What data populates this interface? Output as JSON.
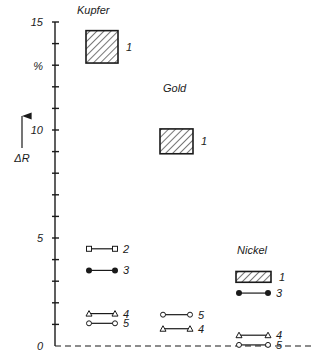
{
  "chart_data": {
    "type": "range",
    "title": "",
    "ylabel": "ΔR",
    "yunit": "%",
    "ylim": [
      0,
      15
    ],
    "yticks_major": [
      0,
      5,
      10,
      15
    ],
    "yticks_minor_step": 1,
    "grid": false,
    "groups": [
      {
        "name": "Kupfer",
        "items": [
          {
            "id": "1",
            "kind": "box",
            "low": 13.1,
            "high": 14.6
          },
          {
            "id": "2",
            "kind": "line",
            "marker": "square-open",
            "value": 4.5
          },
          {
            "id": "3",
            "kind": "line",
            "marker": "circle-filled",
            "value": 3.5
          },
          {
            "id": "4",
            "kind": "line",
            "marker": "triangle-open",
            "value": 1.5
          },
          {
            "id": "5",
            "kind": "line",
            "marker": "circle-open",
            "value": 1.05
          }
        ]
      },
      {
        "name": "Gold",
        "items": [
          {
            "id": "1",
            "kind": "box",
            "low": 8.9,
            "high": 10.05
          },
          {
            "id": "5",
            "kind": "line",
            "marker": "circle-open",
            "value": 1.45
          },
          {
            "id": "4",
            "kind": "line",
            "marker": "triangle-open",
            "value": 0.8
          }
        ]
      },
      {
        "name": "Nickel",
        "items": [
          {
            "id": "1",
            "kind": "box",
            "low": 2.95,
            "high": 3.45
          },
          {
            "id": "3",
            "kind": "line",
            "marker": "circle-filled",
            "value": 2.45
          },
          {
            "id": "4",
            "kind": "line",
            "marker": "triangle-open",
            "value": 0.5
          },
          {
            "id": "5",
            "kind": "line",
            "marker": "circle-open",
            "value": 0.05
          }
        ]
      }
    ]
  }
}
